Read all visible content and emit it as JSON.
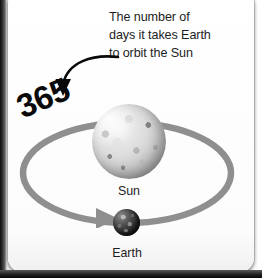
{
  "diagram": {
    "title_annotation": {
      "lines": [
        "The number of",
        "days it takes Earth",
        "to orbit the Sun"
      ]
    },
    "highlight_number": "365",
    "bodies": [
      {
        "name": "sun-body",
        "label": "Sun"
      },
      {
        "name": "earth-body",
        "label": "Earth"
      }
    ],
    "labels": {
      "sun": "Sun",
      "earth": "Earth"
    },
    "colors": {
      "orbit_ring": "#8f8f8f",
      "text": "#1d1d1d",
      "number": "#0a0a0a",
      "card_background": "#ffffff",
      "page_backdrop": "#1a1a1a",
      "sun_highlight": "#f4f4f4",
      "earth_dark": "#111111"
    },
    "icons": {
      "pointer_arrow": "curved-arrow-icon",
      "orbit_direction_arrow": "orbit-arrowhead-icon"
    }
  }
}
